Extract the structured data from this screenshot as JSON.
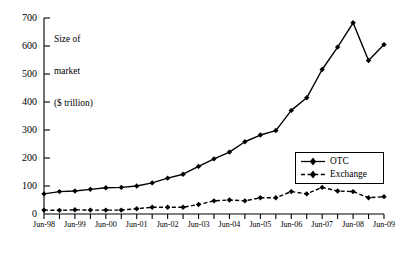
{
  "chart_data": {
    "type": "line",
    "title": "",
    "ylabel": "Size of market ($ trillion)",
    "ylabel_lines": [
      "Size of",
      "market",
      "($ trillion)"
    ],
    "xlabel": "",
    "ylim": [
      0,
      700
    ],
    "yticks": [
      0,
      100,
      200,
      300,
      400,
      500,
      600,
      700
    ],
    "ytick_labels": [
      "0",
      "100",
      "200",
      "300",
      "400",
      "500",
      "600",
      "700"
    ],
    "grid": false,
    "legend_position": "center-right",
    "x": [
      "Jun-98",
      "Dec-98",
      "Jun-99",
      "Dec-99",
      "Jun-00",
      "Dec-00",
      "Jun-01",
      "Dec-01",
      "Jun-02",
      "Dec-02",
      "Jun-03",
      "Dec-03",
      "Jun-04",
      "Dec-04",
      "Jun-05",
      "Dec-05",
      "Jun-06",
      "Dec-06",
      "Jun-07",
      "Dec-07",
      "Jun-08",
      "Dec-08",
      "Jun-09"
    ],
    "xtick_labels": [
      "Jun-98",
      "Jun-99",
      "Jun-00",
      "Jun-01",
      "Jun-02",
      "Jun-03",
      "Jun-04",
      "Jun-05",
      "Jun-06",
      "Jun-07",
      "Jun-08",
      "Jun-09"
    ],
    "series": [
      {
        "name": "OTC",
        "line_style": "solid",
        "marker": "diamond",
        "color": "#000000",
        "values": [
          72,
          80,
          82,
          88,
          94,
          95,
          100,
          111,
          128,
          142,
          170,
          197,
          221,
          258,
          282,
          298,
          370,
          415,
          516,
          596,
          683,
          548,
          605
        ]
      },
      {
        "name": "Exchange",
        "line_style": "dashed",
        "marker": "diamond",
        "color": "#000000",
        "values": [
          14,
          13,
          15,
          14,
          14,
          14,
          19,
          24,
          24,
          24,
          34,
          47,
          50,
          47,
          58,
          58,
          80,
          72,
          95,
          82,
          80,
          58,
          62
        ]
      }
    ]
  },
  "legend": {
    "entries": [
      {
        "label": "OTC",
        "style": "solid",
        "marker": "diamond"
      },
      {
        "label": "Exchange",
        "style": "dashed",
        "marker": "diamond"
      }
    ]
  }
}
